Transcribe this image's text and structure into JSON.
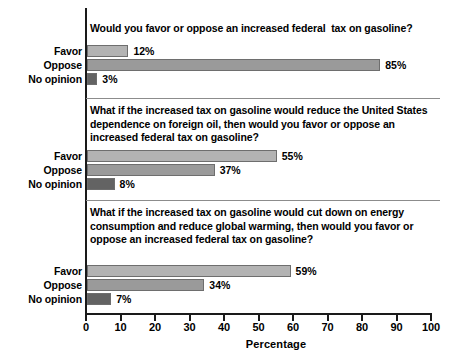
{
  "chart_data": {
    "type": "bar",
    "title": "",
    "xlabel": "Percentage",
    "ylabel": "",
    "xlim": [
      0,
      100
    ],
    "xticks": [
      0,
      10,
      20,
      30,
      40,
      50,
      60,
      70,
      80,
      90,
      100
    ],
    "xtick_labels": [
      "0",
      "10",
      "20",
      "30",
      "40",
      "50",
      "60",
      "70",
      "80",
      "90",
      "100"
    ],
    "grid": false,
    "legend": "none",
    "orientation": "horizontal",
    "categories": [
      "Favor",
      "Oppose",
      "No opinion"
    ],
    "panels": [
      {
        "question": "Would you favor or oppose an increased federal  tax on gasoline?",
        "values": [
          12,
          85,
          3
        ],
        "value_labels": [
          "12%",
          "85%",
          "3%"
        ]
      },
      {
        "question": "What if the increased tax on gasoline would reduce the United States dependence on foreign oil, then would you favor or oppose an increased federal tax on gasoline?",
        "values": [
          55,
          37,
          8
        ],
        "value_labels": [
          "55%",
          "37%",
          "8%"
        ]
      },
      {
        "question": "What if the increased tax on gasoline would cut down on energy consumption and reduce global warming, then would you favor or oppose an increased federal tax on gasoline?",
        "values": [
          59,
          34,
          7
        ],
        "value_labels": [
          "59%",
          "34%",
          "7%"
        ]
      }
    ],
    "colors": {
      "favor": "#b3b3b3",
      "oppose": "#9a9a9a",
      "no_opinion": "#636363",
      "axis": "#1a1a1a",
      "divider": "#8c8c8c",
      "text": "#000000"
    }
  }
}
